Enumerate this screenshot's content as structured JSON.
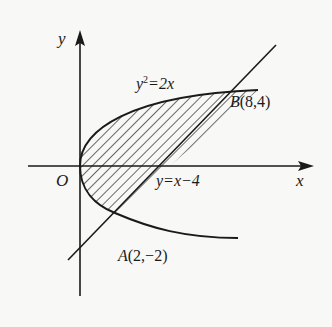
{
  "figure": {
    "axis_x_label": "x",
    "axis_y_label": "y",
    "origin_label": "O",
    "parabola_label_y": "y",
    "parabola_label_exp": "2",
    "parabola_label_rest": "=2x",
    "line_label": "y=x−4",
    "point_b_name": "B",
    "point_b_coords": "(8,4)",
    "point_a_name": "A",
    "point_a_coords": "(2,−2)"
  },
  "colors": {
    "ink": "#1a1a1a",
    "background": "#f8f8f6"
  }
}
